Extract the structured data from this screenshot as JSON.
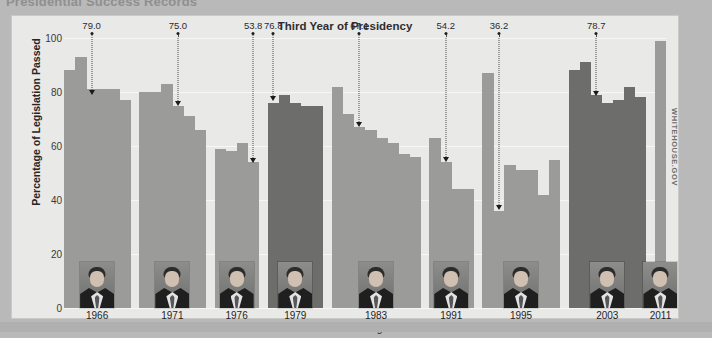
{
  "document": {
    "headline": "Presidential Success Records",
    "watermark": "WHITEHOUSE.GOV"
  },
  "chart_data": {
    "type": "bar",
    "title": "Third Year of Presidency",
    "xlabel": "",
    "ylabel": "Percentage of Legislation Passed",
    "ylim": [
      0,
      100
    ],
    "yticks": [
      0,
      20,
      40,
      60,
      80,
      100
    ],
    "grid": true,
    "legend": null,
    "groups": [
      {
        "year": "1966",
        "president": "Johnson",
        "third_year_value": 79.0,
        "values": [
          88,
          93,
          81,
          81,
          81,
          77
        ]
      },
      {
        "year": "1971",
        "president": "Nixon",
        "third_year_value": 75.0,
        "values": [
          80,
          80,
          83,
          75,
          71,
          66
        ]
      },
      {
        "year": "1976",
        "president": "Ford",
        "third_year_value": 53.8,
        "values": [
          59,
          58,
          61,
          54
        ]
      },
      {
        "year": "1979",
        "president": "Carter",
        "third_year_value": 76.8,
        "values": [
          76,
          79,
          76,
          75,
          75
        ]
      },
      {
        "year": "1983",
        "president": "Reagan",
        "third_year_value": 67.1,
        "values": [
          82,
          72,
          67,
          66,
          63,
          61,
          57,
          56
        ]
      },
      {
        "year": "1991",
        "president": "G.H.W. Bush",
        "third_year_value": 54.2,
        "values": [
          63,
          54,
          44,
          44
        ]
      },
      {
        "year": "1995",
        "president": "Clinton",
        "third_year_value": 36.2,
        "values": [
          87,
          36,
          53,
          51,
          51,
          42,
          55
        ]
      },
      {
        "year": "2003",
        "president": "G.W. Bush",
        "third_year_value": 78.7,
        "values": [
          88,
          91,
          79,
          76,
          77,
          82,
          78
        ]
      },
      {
        "year": "2011",
        "president": "Obama*",
        "third_year_value": null,
        "values": [
          99
        ]
      }
    ],
    "annotations": [
      {
        "label": "79.0",
        "group": "Johnson"
      },
      {
        "label": "75.0",
        "group": "Nixon"
      },
      {
        "label": "53.8",
        "group": "Ford"
      },
      {
        "label": "76.8",
        "group": "Carter"
      },
      {
        "label": "67.1",
        "group": "Reagan"
      },
      {
        "label": "54.2",
        "group": "G.H.W. Bush"
      },
      {
        "label": "36.2",
        "group": "Clinton"
      },
      {
        "label": "78.7",
        "group": "G.W. Bush"
      }
    ]
  },
  "colors": {
    "card_background": "#e9e9e7",
    "page_background": "#b9b9b9",
    "bar": "#9b9b99",
    "bar_dark": "#6d6d6b",
    "gridline": "#f7f7f5",
    "text": "#1f1f1f"
  }
}
